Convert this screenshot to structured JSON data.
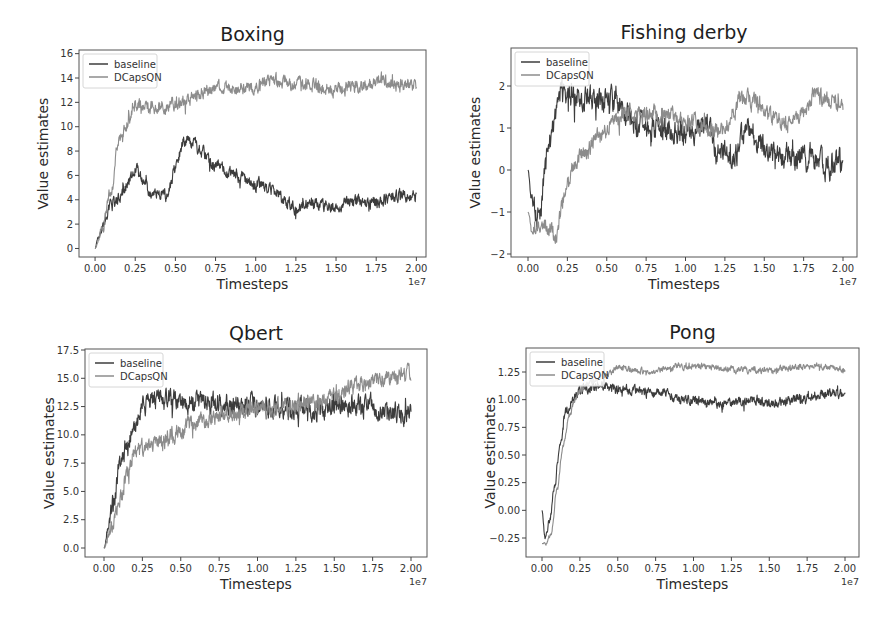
{
  "figure": {
    "width": 895,
    "height": 621,
    "background": "#ffffff"
  },
  "colors": {
    "baseline": "#3c3c3c",
    "dcapsqn": "#8c8c8c",
    "frame": "#555555"
  },
  "legend_labels": [
    "baseline",
    "DCapsQN"
  ],
  "chart_data": [
    {
      "type": "line",
      "title": "Boxing",
      "xlabel": "Timesteps",
      "ylabel": "Value estimates",
      "x_offset_label": "1e7",
      "xlim": [
        -0.1,
        2.06
      ],
      "ylim": [
        -0.7,
        16.3
      ],
      "xticks": [
        0.0,
        0.25,
        0.5,
        0.75,
        1.0,
        1.25,
        1.5,
        1.75,
        2.0
      ],
      "xtick_labels": [
        "0.00",
        "0.25",
        "0.50",
        "0.75",
        "1.00",
        "1.25",
        "1.50",
        "1.75",
        "2.00"
      ],
      "yticks": [
        0,
        2,
        4,
        6,
        8,
        10,
        12,
        14,
        16
      ],
      "ytick_labels": [
        "0",
        "2",
        "4",
        "6",
        "8",
        "10",
        "12",
        "14",
        "16"
      ],
      "legend_position": "upper left",
      "grid": false,
      "px": {
        "left": 79,
        "right": 426,
        "top": 50,
        "bottom": 257
      },
      "series": [
        {
          "name": "baseline",
          "color_key": "baseline",
          "noise": 0.55,
          "seed": 11,
          "x": [
            0.0,
            0.02,
            0.05,
            0.1,
            0.15,
            0.2,
            0.25,
            0.3,
            0.35,
            0.4,
            0.45,
            0.5,
            0.55,
            0.6,
            0.65,
            0.75,
            0.9,
            1.0,
            1.1,
            1.2,
            1.25,
            1.35,
            1.5,
            1.6,
            1.75,
            1.85,
            2.0
          ],
          "y": [
            0.0,
            1.0,
            1.8,
            3.5,
            4.2,
            5.2,
            6.6,
            5.5,
            4.2,
            4.3,
            4.4,
            6.5,
            8.8,
            8.9,
            8.0,
            6.8,
            5.8,
            5.2,
            4.9,
            3.7,
            3.3,
            3.6,
            3.4,
            3.8,
            3.7,
            4.3,
            4.3
          ]
        },
        {
          "name": "DCapsQN",
          "color_key": "dcapsqn",
          "noise": 0.6,
          "seed": 23,
          "x": [
            0.0,
            0.05,
            0.1,
            0.15,
            0.2,
            0.25,
            0.3,
            0.4,
            0.5,
            0.6,
            0.7,
            0.8,
            0.9,
            1.0,
            1.1,
            1.2,
            1.3,
            1.4,
            1.5,
            1.6,
            1.7,
            1.8,
            1.9,
            2.0
          ],
          "y": [
            0.0,
            1.8,
            5.0,
            9.2,
            10.0,
            12.0,
            11.4,
            11.6,
            11.8,
            12.3,
            13.0,
            13.2,
            13.1,
            13.4,
            13.8,
            13.6,
            13.5,
            13.3,
            13.0,
            13.2,
            13.4,
            13.8,
            13.5,
            13.3
          ]
        }
      ]
    },
    {
      "type": "line",
      "title": "Fishing derby",
      "xlabel": "Timesteps",
      "ylabel": "Value estimates",
      "x_offset_label": "1e7",
      "xlim": [
        -0.1,
        2.1
      ],
      "ylim": [
        -2.05,
        2.0
      ],
      "xticks": [
        0.0,
        0.25,
        0.5,
        0.75,
        1.0,
        1.25,
        1.5,
        1.75,
        2.0
      ],
      "xtick_labels": [
        "0.00",
        "0.25",
        "0.50",
        "0.75",
        "1.00",
        "1.25",
        "1.50",
        "1.75",
        "2.00"
      ],
      "yticks": [
        -2,
        -1,
        0,
        1,
        2
      ],
      "ytick_labels": [
        "−2",
        "−1",
        "0",
        "1",
        "2"
      ],
      "legend_position": "upper left",
      "grid": false,
      "px": {
        "left": 511,
        "right": 857,
        "top": 48,
        "bottom": 257
      },
      "y_px_map": {
        "v0": -2,
        "p0": 254,
        "v1": 2,
        "p1": 86
      },
      "x_px_map": {
        "v0": 0,
        "p0": 528,
        "v1": 2,
        "p1": 843
      },
      "series": [
        {
          "name": "baseline",
          "color_key": "baseline",
          "noise": 0.32,
          "seed": 5,
          "x": [
            0.0,
            0.02,
            0.05,
            0.08,
            0.1,
            0.13,
            0.16,
            0.2,
            0.25,
            0.35,
            0.45,
            0.55,
            0.62,
            0.7,
            0.8,
            0.9,
            1.0,
            1.1,
            1.15,
            1.2,
            1.3,
            1.4,
            1.5,
            1.6,
            1.7,
            1.8,
            1.9,
            2.0
          ],
          "y": [
            0.0,
            -0.6,
            -1.0,
            -1.1,
            -0.2,
            0.5,
            1.0,
            1.8,
            1.8,
            1.7,
            1.7,
            1.6,
            1.4,
            1.1,
            1.0,
            0.9,
            0.9,
            1.0,
            1.1,
            0.4,
            0.4,
            0.9,
            0.6,
            0.3,
            0.3,
            0.3,
            0.1,
            0.2
          ]
        },
        {
          "name": "DCapsQN",
          "color_key": "dcapsqn",
          "noise": 0.22,
          "seed": 17,
          "x": [
            0.0,
            0.03,
            0.06,
            0.1,
            0.15,
            0.18,
            0.22,
            0.28,
            0.35,
            0.45,
            0.55,
            0.65,
            0.75,
            0.85,
            0.95,
            1.05,
            1.15,
            1.25,
            1.3,
            1.35,
            1.45,
            1.55,
            1.65,
            1.75,
            1.82,
            1.9,
            2.0
          ],
          "y": [
            -1.0,
            -1.5,
            -1.4,
            -1.4,
            -1.5,
            -1.6,
            -0.8,
            0.0,
            0.4,
            0.8,
            1.2,
            1.4,
            1.4,
            1.3,
            1.2,
            1.1,
            1.0,
            0.9,
            1.4,
            1.7,
            1.6,
            1.2,
            1.1,
            1.3,
            1.8,
            1.7,
            1.5
          ]
        }
      ]
    },
    {
      "type": "line",
      "title": "Qbert",
      "xlabel": "Timesteps",
      "ylabel": "Value estimates",
      "x_offset_label": "1e7",
      "xlim": [
        -0.1,
        2.1
      ],
      "ylim": [
        -0.9,
        17.5
      ],
      "xticks": [
        0.0,
        0.25,
        0.5,
        0.75,
        1.0,
        1.25,
        1.5,
        1.75,
        2.0
      ],
      "xtick_labels": [
        "0.00",
        "0.25",
        "0.50",
        "0.75",
        "1.00",
        "1.25",
        "1.50",
        "1.75",
        "2.00"
      ],
      "yticks": [
        0.0,
        2.5,
        5.0,
        7.5,
        10.0,
        12.5,
        15.0,
        17.5
      ],
      "ytick_labels": [
        "0.0",
        "2.5",
        "5.0",
        "7.5",
        "10.0",
        "12.5",
        "15.0",
        "17.5"
      ],
      "legend_position": "upper left",
      "grid": false,
      "px": {
        "left": 85,
        "right": 427,
        "top": 349,
        "bottom": 557
      },
      "y_px_map": {
        "v0": 0,
        "p0": 548,
        "v1": 17.5,
        "p1": 350
      },
      "x_px_map": {
        "v0": 0,
        "p0": 104,
        "v1": 2,
        "p1": 411
      },
      "series": [
        {
          "name": "baseline",
          "color_key": "baseline",
          "noise": 1.0,
          "seed": 3,
          "x": [
            0.0,
            0.03,
            0.06,
            0.1,
            0.15,
            0.2,
            0.25,
            0.3,
            0.4,
            0.5,
            0.6,
            0.7,
            0.8,
            0.9,
            1.0,
            1.1,
            1.2,
            1.3,
            1.4,
            1.5,
            1.6,
            1.7,
            1.8,
            1.9,
            2.0
          ],
          "y": [
            0.0,
            2.0,
            4.0,
            7.0,
            9.0,
            10.5,
            12.5,
            13.0,
            13.0,
            13.0,
            13.0,
            12.8,
            12.8,
            12.6,
            12.5,
            12.5,
            12.3,
            12.3,
            12.2,
            12.4,
            12.6,
            12.5,
            12.3,
            12.0,
            11.8
          ]
        },
        {
          "name": "DCapsQN",
          "color_key": "dcapsqn",
          "noise": 0.8,
          "seed": 29,
          "x": [
            0.0,
            0.05,
            0.1,
            0.15,
            0.2,
            0.25,
            0.3,
            0.35,
            0.45,
            0.55,
            0.65,
            0.75,
            0.85,
            1.0,
            1.1,
            1.2,
            1.3,
            1.4,
            1.5,
            1.6,
            1.7,
            1.8,
            1.9,
            2.0
          ],
          "y": [
            0.0,
            2.0,
            4.0,
            6.5,
            8.5,
            9.0,
            9.2,
            9.0,
            10.0,
            10.8,
            11.2,
            11.8,
            12.0,
            12.2,
            12.3,
            12.6,
            12.8,
            13.0,
            13.4,
            14.0,
            14.5,
            15.0,
            15.4,
            15.2
          ]
        }
      ]
    },
    {
      "type": "line",
      "title": "Pong",
      "xlabel": "Timesteps",
      "ylabel": "Value estimates",
      "x_offset_label": "1e7",
      "xlim": [
        -0.1,
        2.1
      ],
      "ylim": [
        -0.42,
        1.46
      ],
      "xticks": [
        0.0,
        0.25,
        0.5,
        0.75,
        1.0,
        1.25,
        1.5,
        1.75,
        2.0
      ],
      "xtick_labels": [
        "0.00",
        "0.25",
        "0.50",
        "0.75",
        "1.00",
        "1.25",
        "1.50",
        "1.75",
        "2.00"
      ],
      "yticks": [
        -0.25,
        0.0,
        0.25,
        0.5,
        0.75,
        1.0,
        1.25
      ],
      "ytick_labels": [
        "−0.25",
        "0.00",
        "0.25",
        "0.50",
        "0.75",
        "1.00",
        "1.25"
      ],
      "legend_position": "upper left",
      "grid": false,
      "px": {
        "left": 526,
        "right": 859,
        "top": 348,
        "bottom": 557
      },
      "y_px_map": {
        "v0": -0.25,
        "p0": 538,
        "v1": 1.25,
        "p1": 372
      },
      "x_px_map": {
        "v0": 0,
        "p0": 542,
        "v1": 2,
        "p1": 845
      },
      "series": [
        {
          "name": "baseline",
          "color_key": "baseline",
          "noise": 0.045,
          "seed": 7,
          "x": [
            0.0,
            0.02,
            0.05,
            0.08,
            0.12,
            0.16,
            0.2,
            0.25,
            0.3,
            0.4,
            0.5,
            0.6,
            0.7,
            0.8,
            0.9,
            1.0,
            1.1,
            1.2,
            1.3,
            1.4,
            1.5,
            1.6,
            1.7,
            1.8,
            1.9,
            2.0
          ],
          "y": [
            0.0,
            -0.25,
            -0.1,
            0.2,
            0.6,
            0.9,
            1.0,
            1.08,
            1.1,
            1.12,
            1.1,
            1.08,
            1.05,
            1.07,
            1.0,
            1.0,
            0.98,
            0.96,
            0.98,
            1.0,
            0.98,
            0.97,
            1.0,
            1.04,
            1.06,
            1.05
          ]
        },
        {
          "name": "DCapsQN",
          "color_key": "dcapsqn",
          "noise": 0.03,
          "seed": 31,
          "x": [
            0.0,
            0.03,
            0.06,
            0.1,
            0.14,
            0.18,
            0.22,
            0.26,
            0.3,
            0.4,
            0.5,
            0.6,
            0.7,
            0.8,
            0.9,
            1.0,
            1.1,
            1.2,
            1.3,
            1.4,
            1.5,
            1.6,
            1.7,
            1.8,
            1.9,
            2.0
          ],
          "y": [
            -0.3,
            -0.3,
            -0.2,
            0.2,
            0.6,
            0.85,
            1.0,
            1.1,
            1.15,
            1.2,
            1.28,
            1.27,
            1.25,
            1.28,
            1.3,
            1.3,
            1.29,
            1.28,
            1.27,
            1.27,
            1.26,
            1.28,
            1.3,
            1.32,
            1.29,
            1.27
          ]
        }
      ]
    }
  ]
}
